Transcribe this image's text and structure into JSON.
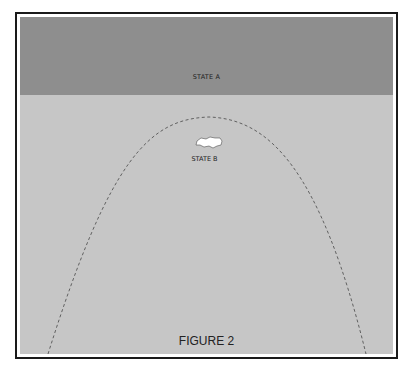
{
  "figure": {
    "caption": "FIGURE 2",
    "regions": {
      "state_a": {
        "label": "STATE A",
        "color": "#8e8e8e"
      },
      "background": {
        "color": "#c6c6c6"
      },
      "state_b": {
        "label": "STATE B",
        "blob_color": "#ffffff"
      }
    },
    "boundary": {
      "style": "dashed",
      "shape": "parabola",
      "color": "#555555"
    }
  }
}
